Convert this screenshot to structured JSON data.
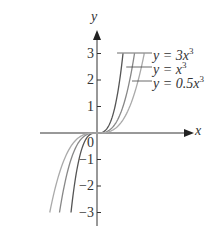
{
  "chart_data": {
    "type": "line",
    "title": "",
    "xlabel": "x",
    "ylabel": "y",
    "xlim": [
      -1.85,
      1.85
    ],
    "ylim": [
      -3,
      3
    ],
    "yticks": [
      -3,
      -2,
      -1,
      0,
      1,
      2,
      3
    ],
    "ytick_labels": [
      "−3",
      "−2",
      "−1",
      "0",
      "1",
      "2",
      "3"
    ],
    "origin_label": "0",
    "grid": false,
    "legend_position": "annotations at top-right of curves",
    "series": [
      {
        "name": "y = 3x^3",
        "coef": 3,
        "color": "#555555",
        "x": [
          -1,
          -0.5,
          0,
          0.5,
          1
        ],
        "y": [
          -3,
          -0.375,
          0,
          0.375,
          3
        ]
      },
      {
        "name": "y = x^3",
        "coef": 1,
        "color": "#888888",
        "x": [
          -1.44,
          -1,
          0,
          1,
          1.44
        ],
        "y": [
          -3,
          -1,
          0,
          1,
          3
        ]
      },
      {
        "name": "y = 0.5x^3",
        "coef": 0.5,
        "color": "#aaaaaa",
        "x": [
          -1.82,
          -1,
          0,
          1,
          1.82
        ],
        "y": [
          -3,
          -0.5,
          0,
          0.5,
          3
        ]
      }
    ]
  },
  "labels": {
    "x_axis": "x",
    "y_axis": "y",
    "legend": [
      {
        "prefix": "y = 3x",
        "exp": "3"
      },
      {
        "prefix": "y = x",
        "exp": "3"
      },
      {
        "prefix": "y = 0.5x",
        "exp": "3"
      }
    ]
  }
}
